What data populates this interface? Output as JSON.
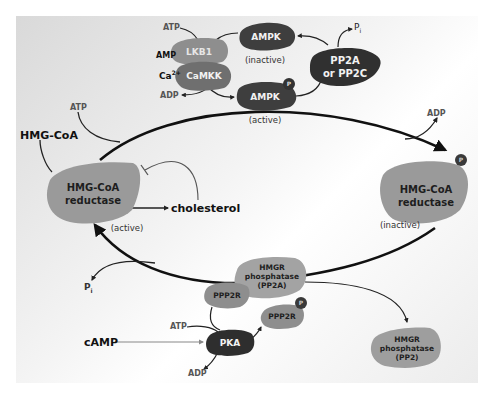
{
  "ampk_cycle": {
    "lkb1": "LKB1",
    "camkk": "CaMKK",
    "ampk_inactive": "AMPK",
    "ampk_inactive_state": "(inactive)",
    "ampk_active": "AMPK",
    "ampk_active_state": "(active)",
    "pp2a_pp2c_line1": "PP2A",
    "pp2a_pp2c_line2": "or PP2C",
    "atp": "ATP",
    "amp": "AMP",
    "ca2": "Ca",
    "ca2_sup": "2+",
    "adp": "ADP",
    "pi": "P",
    "pi_sub": "i",
    "phospho": "P"
  },
  "main_cycle": {
    "hmg_coa_substrate": "HMG-CoA",
    "atp": "ATP",
    "adp": "ADP",
    "pi": "P",
    "pi_sub": "i",
    "reductase_active_line1": "HMG-CoA",
    "reductase_active_line2": "reductase",
    "reductase_active_state": "(active)",
    "cholesterol": "cholesterol",
    "reductase_inactive_line1": "HMG-CoA",
    "reductase_inactive_line2": "reductase",
    "reductase_inactive_state": "(inactive)",
    "phospho": "P"
  },
  "phosphatase_regulation": {
    "hmgr_pp2a_line1": "HMGR",
    "hmgr_pp2a_line2": "phosphatase",
    "hmgr_pp2a_line3": "(PP2A)",
    "ppp2r_bound": "PPP2R",
    "ppp2r_phospho": "PPP2R",
    "pka": "PKA",
    "camp": "cAMP",
    "atp": "ATP",
    "adp": "ADP",
    "hmgr_pp2_line1": "HMGR",
    "hmgr_pp2_line2": "phosphatase",
    "hmgr_pp2_line3": "(PP2)",
    "phospho": "P"
  },
  "colors": {
    "dark_enzyme": "#3a3a3a",
    "mid_enzyme": "#8a8a8a",
    "light_enzyme": "#a8a8a8",
    "arrow": "#111111",
    "gray_arrow": "#777777"
  }
}
